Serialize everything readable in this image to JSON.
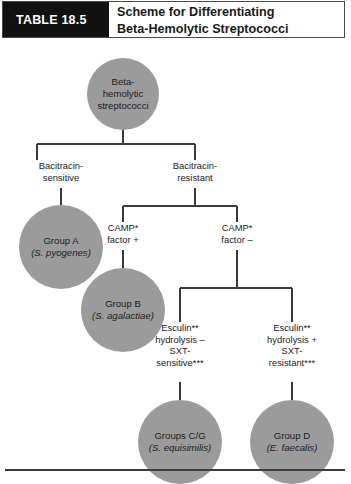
{
  "header": {
    "tag": "TABLE 18.5",
    "title_line1": "Scheme for Differentiating",
    "title_line2": "Beta-Hemolytic Streptococci"
  },
  "colors": {
    "node_fill": "#9b9b9b",
    "header_tag_bg": "#111111",
    "line": "#3a3a3a",
    "text": "#1d1d1d",
    "background": "#ffffff"
  },
  "diagram": {
    "type": "flowchart",
    "orientation": "top-down",
    "nodes": [
      {
        "id": "root",
        "label_line1": "Beta-",
        "label_line2": "hemolytic",
        "label_line3": "streptococci",
        "species": ""
      },
      {
        "id": "group-a",
        "label_line1": "Group A",
        "species": "(S. pyogenes)"
      },
      {
        "id": "group-b",
        "label_line1": "Group B",
        "species": "(S. agalactiae)"
      },
      {
        "id": "groups-cg",
        "label_line1": "Groups C/G",
        "species": "(S. equisimilis)"
      },
      {
        "id": "group-d",
        "label_line1": "Group D",
        "species": "(E. faecalis)"
      }
    ],
    "edge_labels": [
      {
        "id": "bacitracin-sensitive",
        "text": "Bacitracin-\nsensitive"
      },
      {
        "id": "bacitracin-resistant",
        "text": "Bacitracin-\nresistant"
      },
      {
        "id": "camp-positive",
        "text": "CAMP*\nfactor +"
      },
      {
        "id": "camp-negative",
        "text": "CAMP*\nfactor –"
      },
      {
        "id": "esculin-negative-sxt-sensitive",
        "text": "Esculin**\nhydrolysis –\nSXT-\nsensitive***"
      },
      {
        "id": "esculin-positive-sxt-resistant",
        "text": "Esculin**\nhydrolysis +\nSXT-\nresistant***"
      }
    ]
  }
}
